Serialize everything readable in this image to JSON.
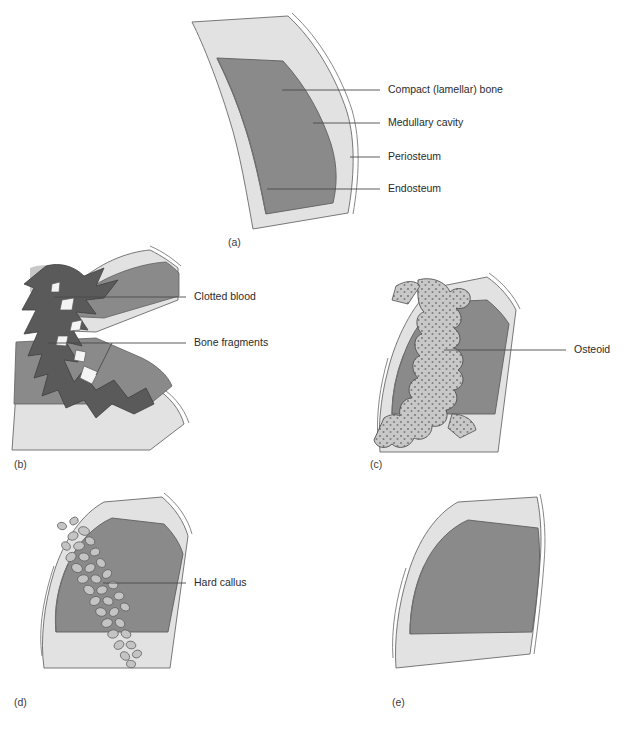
{
  "figure": {
    "panel_count": 5,
    "colors": {
      "periosteum": "#e2e2e2",
      "compact_bone": "#d8d8d8",
      "medullary_cavity": "#8a8a8a",
      "endosteum_line": "#6f6f6f",
      "clotted_blood": "#5a5a5a",
      "bone_fragment": "#f4f4f4",
      "osteoid_fill": "#c8c8c8",
      "osteoid_stipple": "#7d7d7d",
      "hard_callus_fill": "#c4c4c4",
      "hard_callus_stroke": "#5f5f5f",
      "outline": "#5a5a5a",
      "leader_line": "#4a4a4a",
      "text": "#2b2b2b",
      "background": "#ffffff"
    }
  },
  "panels": [
    {
      "letter": "(a)",
      "name": "intact-bone",
      "labels": [
        {
          "text": "Compact (lamellar) bone",
          "target": "compact-bone"
        },
        {
          "text": "Medullary cavity",
          "target": "medullary-cavity"
        },
        {
          "text": "Periosteum",
          "target": "periosteum"
        },
        {
          "text": "Endosteum",
          "target": "endosteum"
        }
      ]
    },
    {
      "letter": "(b)",
      "name": "fracture-hematoma",
      "labels": [
        {
          "text": "Clotted blood",
          "target": "clotted-blood"
        },
        {
          "text": "Bone fragments",
          "target": "bone-fragments"
        }
      ]
    },
    {
      "letter": "(c)",
      "name": "soft-callus-osteoid",
      "labels": [
        {
          "text": "Osteoid",
          "target": "osteoid"
        }
      ]
    },
    {
      "letter": "(d)",
      "name": "hard-callus",
      "labels": [
        {
          "text": "Hard callus",
          "target": "hard-callus"
        }
      ]
    },
    {
      "letter": "(e)",
      "name": "remodelled-bone",
      "labels": []
    }
  ]
}
